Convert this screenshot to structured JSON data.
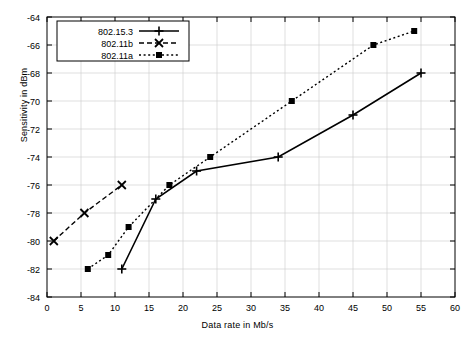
{
  "chart_data": {
    "type": "line",
    "title": "",
    "xlabel": "Data rate in Mb/s",
    "ylabel": "Sensitivity in dBm",
    "xlim": [
      0,
      60
    ],
    "ylim": [
      -84,
      -64
    ],
    "xticks": [
      0,
      5,
      10,
      15,
      20,
      25,
      30,
      35,
      40,
      45,
      50,
      55,
      60
    ],
    "yticks": [
      -84,
      -82,
      -80,
      -78,
      -76,
      -74,
      -72,
      -70,
      -68,
      -66,
      -64
    ],
    "grid": true,
    "legend_position": "top-left",
    "series": [
      {
        "name": "802.15.3",
        "style": "solid",
        "marker": "plus",
        "x": [
          11,
          16,
          22,
          34,
          45,
          55
        ],
        "y": [
          -82,
          -77,
          -75,
          -74,
          -71,
          -68
        ]
      },
      {
        "name": "802.11b",
        "style": "dashed",
        "marker": "cross",
        "x": [
          1,
          5.5,
          11
        ],
        "y": [
          -80,
          -78,
          -76
        ]
      },
      {
        "name": "802.11a",
        "style": "dotted",
        "marker": "square",
        "x": [
          6,
          9,
          12,
          18,
          24,
          36,
          48,
          54
        ],
        "y": [
          -82,
          -81,
          -79,
          -76,
          -74,
          -70,
          -66,
          -65
        ]
      }
    ]
  },
  "legend": {
    "entries": [
      {
        "label": "802.15.3"
      },
      {
        "label": "802.11b"
      },
      {
        "label": "802.11a"
      }
    ]
  },
  "axes": {
    "x_tick_labels": [
      "0",
      "5",
      "10",
      "15",
      "20",
      "25",
      "30",
      "35",
      "40",
      "45",
      "50",
      "55",
      "60"
    ],
    "y_tick_labels": [
      "-84",
      "-82",
      "-80",
      "-78",
      "-76",
      "-74",
      "-72",
      "-70",
      "-68",
      "-66",
      "-64"
    ],
    "x_axis_title": "Data rate in Mb/s",
    "y_axis_title": "Sensitivity in dBm"
  }
}
